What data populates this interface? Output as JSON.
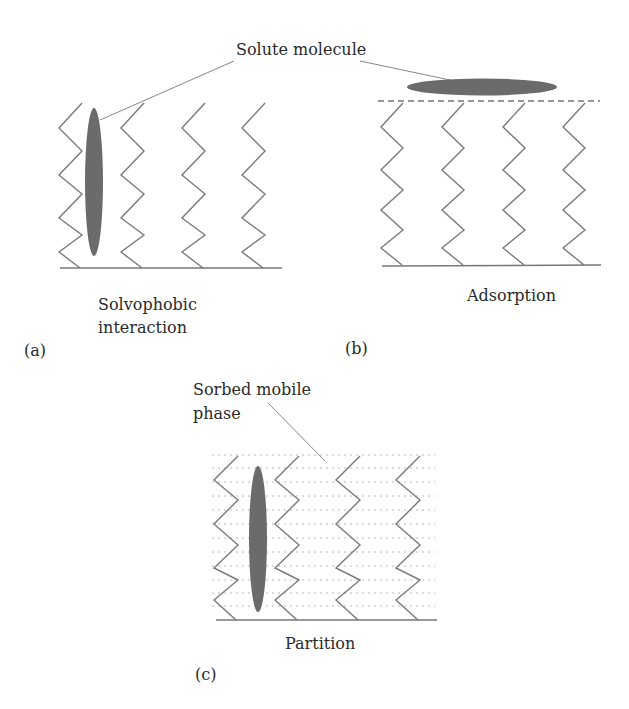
{
  "figure": {
    "callout_solute": "Solute molecule",
    "panels": [
      {
        "id": "a",
        "label": "(a)",
        "caption_line1": "Solvophobic",
        "caption_line2": "interaction"
      },
      {
        "id": "b",
        "label": "(b)",
        "caption_line1": "Adsorption"
      },
      {
        "id": "c",
        "label": "(c)",
        "caption_line1": "Partition",
        "callout_line1": "Sorbed mobile",
        "callout_line2": "phase"
      }
    ],
    "colors": {
      "line": "#777777",
      "molecule": "#6b6b6b",
      "text": "#2a2a2a",
      "dotted": "#bbbbbb"
    }
  }
}
